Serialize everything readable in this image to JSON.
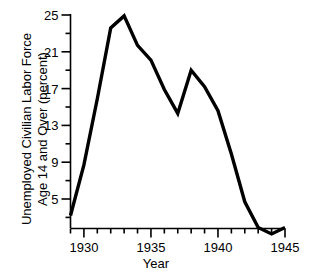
{
  "chart_data": {
    "type": "line",
    "title": "",
    "xlabel": "Year",
    "ylabel_lines": [
      "Unemployed Civilian Labor Force",
      "Age 14 and Over (percent)"
    ],
    "ylabel": "Unemployed Civilian Labor Force Age 14 and Over (percent)",
    "x": [
      1929,
      1930,
      1931,
      1932,
      1933,
      1934,
      1935,
      1936,
      1937,
      1938,
      1939,
      1940,
      1941,
      1942,
      1943,
      1944,
      1945
    ],
    "values": [
      3.2,
      8.7,
      15.9,
      23.6,
      24.9,
      21.7,
      20.1,
      16.9,
      14.3,
      19.0,
      17.2,
      14.6,
      9.9,
      4.7,
      1.9,
      1.2,
      1.9
    ],
    "series": [
      {
        "name": "Unemployment rate",
        "values": [
          3.2,
          8.7,
          15.9,
          23.6,
          24.9,
          21.7,
          20.1,
          16.9,
          14.3,
          19.0,
          17.2,
          14.6,
          9.9,
          4.7,
          1.9,
          1.2,
          1.9
        ]
      }
    ],
    "xlim": [
      1929,
      1945
    ],
    "ylim": [
      1.0,
      25.0
    ],
    "xticks_major": [
      1930,
      1935,
      1940,
      1945
    ],
    "xticks_major_labels": [
      "1930",
      "1935",
      "1940",
      "1945"
    ],
    "xticks_minor": [
      1929,
      1931,
      1932,
      1933,
      1934,
      1936,
      1937,
      1938,
      1939,
      1941,
      1942,
      1943,
      1944
    ],
    "yticks_major": [
      5,
      9,
      13,
      17,
      21,
      25
    ],
    "yticks_major_labels": [
      "5",
      "9",
      "13",
      "17",
      "21",
      "25"
    ],
    "yticks_minor": [
      3,
      7,
      11,
      15,
      19,
      23
    ],
    "grid": false,
    "legend": false,
    "line_color": "#000000",
    "line_width": 3.4,
    "axis_color": "#000000",
    "background": "#ffffff"
  }
}
